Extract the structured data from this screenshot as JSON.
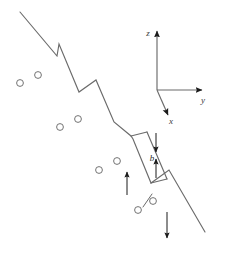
{
  "figure": {
    "background_color": "#ffffff",
    "line_color": "#6b6b6b",
    "arrow_color": "#1a1a1a",
    "atom_stroke_color": "#6b6b6b",
    "label_color": "#2b2b2b"
  },
  "axes": {
    "name": "coordinate-axes",
    "origin": [
      157,
      90
    ],
    "z": {
      "label": "z",
      "label_pos": [
        148,
        36
      ],
      "tip": [
        157,
        31
      ]
    },
    "y": {
      "label": "y",
      "label_pos": [
        203,
        103
      ],
      "tip": [
        202,
        90
      ]
    },
    "x": {
      "label": "x",
      "label_pos": [
        171,
        124
      ],
      "tip": [
        168,
        115
      ]
    }
  },
  "dislocation": {
    "name": "dislocation-line",
    "description": "Main diagonal dislocation line running from upper-left to lower-right containing two jogs",
    "start": [
      20,
      12
    ],
    "end": [
      205,
      232
    ],
    "path": "M20,12 L57,56 L59,44 L79,92 L96,80 L114,122 L131,136 L133,139 L151,183 L169,170 L205,232",
    "jogs": [
      {
        "name": "jog-upper",
        "apex": [
          59,
          44
        ]
      },
      {
        "name": "jog-middle",
        "apex": [
          96,
          80
        ]
      },
      {
        "name": "jog-lower",
        "apex": [
          169,
          170
        ]
      }
    ]
  },
  "dipole": {
    "name": "dislocation-dipole",
    "description": "Pair of closely spaced parallel dislocation segments forming a dipole in the lower right region",
    "segment_a": "M131,136 L151,183",
    "segment_b": "M147,132 L167,179",
    "upper_edge": "M131,136 L147,132",
    "lower_edge": "M151,183 L167,179"
  },
  "burgers_vector": {
    "name": "burgers-vector",
    "label": "b",
    "label_pos": [
      152,
      161
    ],
    "arrow_down": {
      "from": [
        156,
        133
      ],
      "to": [
        156,
        152
      ]
    },
    "arrow_up": {
      "from": [
        156,
        178
      ],
      "to": [
        156,
        159
      ]
    }
  },
  "motion_arrows": [
    {
      "name": "arrow-glide-up-left",
      "label": "",
      "from": [
        127,
        195
      ],
      "to": [
        127,
        172
      ]
    },
    {
      "name": "arrow-glide-down-right",
      "label": "",
      "from": [
        167,
        212
      ],
      "to": [
        167,
        238
      ]
    }
  ],
  "atoms": {
    "name": "atom-circles",
    "radius": 3.4,
    "groups": [
      {
        "name": "atom-row-upper",
        "positions": [
          [
            20,
            83
          ],
          [
            38,
            75
          ]
        ]
      },
      {
        "name": "atom-row-middle",
        "positions": [
          [
            60,
            127
          ],
          [
            78,
            119
          ]
        ]
      },
      {
        "name": "atom-row-lower",
        "positions": [
          [
            99,
            170
          ],
          [
            117,
            161
          ]
        ]
      },
      {
        "name": "atom-row-bottom",
        "positions": [
          [
            138,
            210
          ],
          [
            153,
            201
          ]
        ]
      }
    ]
  },
  "tick_mark": {
    "name": "slip-plane-tick",
    "from": [
      143,
      207
    ],
    "to": [
      152,
      194
    ]
  }
}
